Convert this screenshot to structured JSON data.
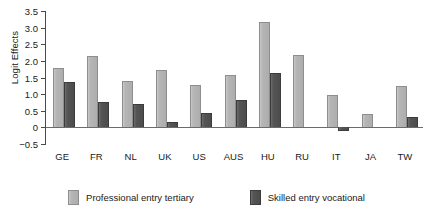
{
  "chart_data": {
    "type": "bar",
    "title": "",
    "xlabel": "",
    "ylabel": "Logit Effects",
    "ylim": [
      -0.5,
      3.5
    ],
    "yticks": [
      3.5,
      3.0,
      2.5,
      2.0,
      1.5,
      1.0,
      0.5,
      0,
      -0.5
    ],
    "ytick_labels": [
      "3.5",
      "3.0",
      "2.5",
      "2.0",
      "1.5",
      "1.0",
      "0.5",
      "0",
      "−0.5"
    ],
    "grid": false,
    "legend_position": "bottom",
    "categories": [
      "GE",
      "FR",
      "NL",
      "UK",
      "US",
      "AUS",
      "HU",
      "RU",
      "IT",
      "JA",
      "TW"
    ],
    "series": [
      {
        "name": "Professional entry tertiary",
        "color": "#b6b6b6",
        "values": [
          1.8,
          2.14,
          1.4,
          1.72,
          1.27,
          1.58,
          3.16,
          2.18,
          0.97,
          0.4,
          1.23
        ]
      },
      {
        "name": "Skilled entry vocational",
        "color": "#525252",
        "values": [
          1.36,
          0.76,
          0.69,
          0.15,
          0.42,
          0.82,
          1.63,
          null,
          -0.1,
          null,
          0.3
        ]
      }
    ]
  },
  "legend": {
    "items": [
      {
        "label": "Professional entry tertiary",
        "swatch": "light-gray-swatch"
      },
      {
        "label": "Skilled entry vocational",
        "swatch": "dark-gray-swatch"
      }
    ]
  },
  "axes": {
    "y_title": "Logit Effects"
  }
}
